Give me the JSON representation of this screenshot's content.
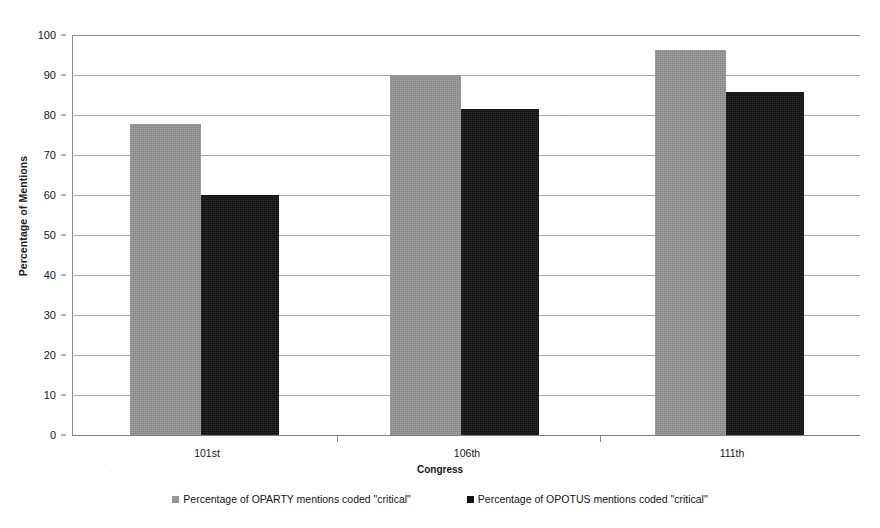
{
  "chart_data": {
    "type": "bar",
    "title": "",
    "xlabel": "Congress",
    "ylabel": "Percentage of Mentions",
    "categories": [
      "101st",
      "106th",
      "111th"
    ],
    "series": [
      {
        "name": "Percentage of OPARTY mentions coded \"critical\"",
        "color": "#969696",
        "values": [
          77.8,
          90.0,
          96.2
        ]
      },
      {
        "name": "Percentage of OPOTUS mentions coded \"critical\"",
        "color": "#111111",
        "values": [
          60.0,
          81.5,
          85.7
        ]
      }
    ],
    "ylim": [
      0,
      100
    ],
    "yticks": [
      0,
      10,
      20,
      30,
      40,
      50,
      60,
      70,
      80,
      90,
      100
    ],
    "ytick_labels": [
      "0",
      "10",
      "20",
      "30",
      "40",
      "50",
      "60",
      "70",
      "80",
      "90",
      "100"
    ],
    "grid": true,
    "grid_axis": "y",
    "legend_position": "bottom"
  },
  "axes": {
    "y_title": "Percentage of Mentions",
    "x_title": "Congress"
  },
  "legend": {
    "items": [
      {
        "label": "Percentage of OPARTY mentions coded \"critical\"",
        "swatch": "gray"
      },
      {
        "label": "Percentage of OPOTUS mentions coded \"critical\"",
        "swatch": "black"
      }
    ]
  },
  "colors": {
    "series_one": "#969696",
    "series_two": "#111111",
    "gridline": "#a9a9a9",
    "axis": "#8a8a8a",
    "background": "#ffffff",
    "text": "#161616"
  }
}
